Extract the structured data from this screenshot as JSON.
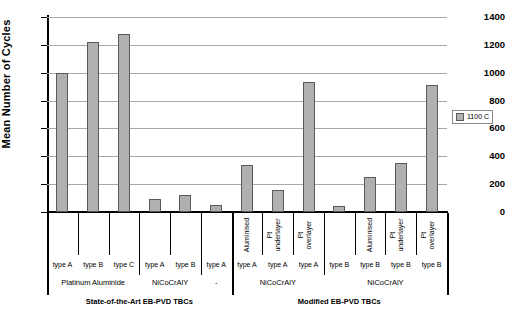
{
  "chart_data": {
    "type": "bar",
    "title": "",
    "subtitle": "",
    "xlabel": "",
    "ylabel": "Mean Number of Cycles",
    "ylim": [
      0,
      1400
    ],
    "ytick_step": 200,
    "yticks": [
      "1400",
      "1200",
      "1000",
      "800",
      "600",
      "400",
      "200",
      "0"
    ],
    "grid": true,
    "legend_position": "right",
    "legend": [
      "1100 C"
    ],
    "series": [
      {
        "name": "1100 C",
        "values": [
          1000,
          1220,
          1280,
          90,
          120,
          50,
          335,
          160,
          930,
          45,
          250,
          355,
          915
        ]
      }
    ],
    "categories": [
      "type A",
      "type B",
      "type C",
      "type A",
      "type B",
      "type A",
      "type A",
      "type A",
      "type A",
      "type B",
      "type B",
      "type B",
      "type B"
    ],
    "coating_labels": [
      "",
      "",
      "",
      "",
      "",
      "",
      "Aluminised",
      "Pt underlayer",
      "Pt overlayer",
      "",
      "Aluminised",
      "Pt underlayer",
      "Pt overlayer"
    ],
    "groups_level2": [
      {
        "label": "Platinum Aluminide",
        "span": [
          0,
          2
        ]
      },
      {
        "label": "NiCoCrAlY",
        "span": [
          3,
          4
        ]
      },
      {
        "label": "-",
        "span": [
          5,
          5
        ]
      },
      {
        "label": "NiCoCrAlY",
        "span": [
          6,
          8
        ]
      },
      {
        "label": "NiCoCrAlY",
        "span": [
          9,
          12
        ]
      }
    ],
    "groups_level3": [
      {
        "label": "State-of-the-Art EB-PVD TBCs",
        "span": [
          0,
          5
        ]
      },
      {
        "label": "Modified EB-PVD TBCs",
        "span": [
          6,
          12
        ]
      }
    ],
    "colors": {
      "bar_fill": "#b0b0b0",
      "bar_stroke": "#5a5a5a",
      "gridline": "#a8a8a8",
      "axis": "#000000",
      "background": "#ffffff"
    }
  },
  "legend_box": {
    "label": "1100 C"
  }
}
